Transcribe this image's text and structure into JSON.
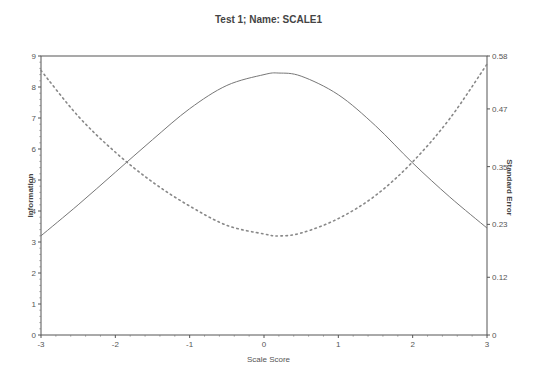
{
  "chart_data": {
    "type": "line",
    "title": "Test  1; Name: SCALE1",
    "xlabel": "Scale Score",
    "ylabel": "Information",
    "ylabel_right": "Standard Error",
    "xlim": [
      -3,
      3
    ],
    "ylim": [
      0,
      9
    ],
    "ylim_right": [
      0,
      0.58
    ],
    "x_ticks": [
      "-3",
      "-2",
      "-1",
      "0",
      "1",
      "2",
      "3"
    ],
    "y_ticks": [
      "0",
      "1",
      "2",
      "3",
      "4",
      "5",
      "6",
      "7",
      "8",
      "9"
    ],
    "y_ticks_right": [
      "0",
      "0.12",
      "0.23",
      "0.35",
      "0.47",
      "0.58"
    ],
    "grid": false,
    "x": [
      -3,
      -2.5,
      -2,
      -1.5,
      -1,
      -0.5,
      0,
      0.2,
      0.5,
      1,
      1.5,
      2,
      2.5,
      3
    ],
    "series": [
      {
        "name": "Information",
        "axis": "left",
        "style": "solid",
        "values": [
          3.2,
          4.2,
          5.25,
          6.3,
          7.3,
          8.05,
          8.4,
          8.45,
          8.35,
          7.75,
          6.75,
          5.55,
          4.45,
          3.45
        ]
      },
      {
        "name": "Standard Error",
        "axis": "right",
        "style": "dotted",
        "values": [
          0.55,
          0.455,
          0.38,
          0.318,
          0.268,
          0.228,
          0.21,
          0.206,
          0.212,
          0.242,
          0.29,
          0.36,
          0.45,
          0.563
        ]
      }
    ]
  }
}
